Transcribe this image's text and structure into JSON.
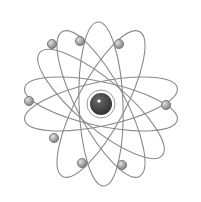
{
  "image": {
    "subject": "atom illustration",
    "background": "#ffffff",
    "orbit_color": "#8a8a8a",
    "nucleus": {
      "cx": 101,
      "cy": 104,
      "r": 11,
      "ring_r": 14,
      "fill": "#4a4a4a"
    },
    "orbits": [
      {
        "rx": 78,
        "ry": 22,
        "rotate": -12
      },
      {
        "rx": 78,
        "ry": 22,
        "rotate": 12
      },
      {
        "rx": 82,
        "ry": 24,
        "rotate": 62
      },
      {
        "rx": 82,
        "ry": 24,
        "rotate": -62
      },
      {
        "rx": 82,
        "ry": 22,
        "rotate": 88
      },
      {
        "rx": 80,
        "ry": 24,
        "rotate": 40
      }
    ],
    "electrons": [
      {
        "cx": 52,
        "cy": 44
      },
      {
        "cx": 80,
        "cy": 41
      },
      {
        "cx": 119,
        "cy": 44
      },
      {
        "cx": 29,
        "cy": 101
      },
      {
        "cx": 166,
        "cy": 105
      },
      {
        "cx": 54,
        "cy": 138
      },
      {
        "cx": 82,
        "cy": 163
      },
      {
        "cx": 122,
        "cy": 165
      }
    ],
    "electron_fill": "#a8a8a8"
  }
}
